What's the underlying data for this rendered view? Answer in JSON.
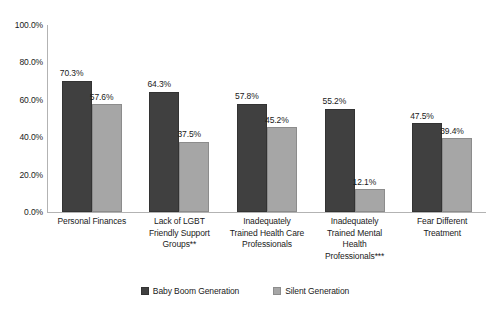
{
  "chart_data": {
    "type": "bar",
    "title": "",
    "subtitle": "",
    "xlabel": "",
    "ylabel": "",
    "ylim": [
      0,
      100
    ],
    "ytick_labels": [
      "0.0%",
      "20.0%",
      "40.0%",
      "60.0%",
      "80.0%",
      "100.0%"
    ],
    "ytick_values": [
      0,
      20,
      40,
      60,
      80,
      100
    ],
    "grid": false,
    "legend_position": "bottom",
    "value_suffix": "%",
    "categories": [
      "Personal Finances",
      "Lack of LGBT Friendly Support Groups**",
      "Inadequately Trained Health Care Professionals",
      "Inadequately Trained Mental Health Professionals***",
      "Fear Different Treatment"
    ],
    "category_lines": [
      [
        "Personal Finances"
      ],
      [
        "Lack of LGBT",
        "Friendly Support",
        "Groups**"
      ],
      [
        "Inadequately",
        "Trained Health Care",
        "Professionals"
      ],
      [
        "Inadequately",
        "Trained Mental",
        "Health",
        "Professionals***"
      ],
      [
        "Fear Different",
        "Treatment"
      ]
    ],
    "series": [
      {
        "name": "Baby Boom Generation",
        "color": "#404040",
        "values": [
          70.3,
          64.3,
          57.8,
          55.2,
          47.5
        ],
        "labels": [
          "70.3%",
          "64.3%",
          "57.8%",
          "55.2%",
          "47.5%"
        ]
      },
      {
        "name": "Silent Generation",
        "color": "#a6a6a6",
        "values": [
          57.6,
          37.5,
          45.2,
          12.1,
          39.4
        ],
        "labels": [
          "57.6%",
          "37.5%",
          "45.2%",
          "12.1%",
          "39.4%"
        ]
      }
    ]
  }
}
